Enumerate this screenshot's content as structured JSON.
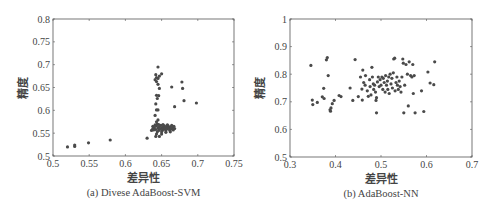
{
  "chart_data": [
    {
      "type": "scatter",
      "caption": "(a) Divese AdaBoost-SVM",
      "xlabel": "差异性",
      "ylabel": "精度",
      "xlim": [
        0.5,
        0.75
      ],
      "ylim": [
        0.5,
        0.8
      ],
      "xticks": [
        "0.5",
        "0.55",
        "0.6",
        "0.65",
        "0.7",
        "0.75"
      ],
      "yticks": [
        "0.5",
        "0.55",
        "0.6",
        "0.65",
        "0.7",
        "0.75",
        "0.8"
      ],
      "grid": false,
      "points": [
        [
          0.52,
          0.52
        ],
        [
          0.53,
          0.521
        ],
        [
          0.53,
          0.524
        ],
        [
          0.549,
          0.529
        ],
        [
          0.579,
          0.535
        ],
        [
          0.63,
          0.539
        ],
        [
          0.642,
          0.543
        ],
        [
          0.647,
          0.543
        ],
        [
          0.643,
          0.548
        ],
        [
          0.65,
          0.548
        ],
        [
          0.636,
          0.556
        ],
        [
          0.638,
          0.56
        ],
        [
          0.638,
          0.565
        ],
        [
          0.64,
          0.562
        ],
        [
          0.642,
          0.558
        ],
        [
          0.643,
          0.566
        ],
        [
          0.645,
          0.561
        ],
        [
          0.646,
          0.556
        ],
        [
          0.647,
          0.564
        ],
        [
          0.648,
          0.559
        ],
        [
          0.649,
          0.567
        ],
        [
          0.65,
          0.561
        ],
        [
          0.651,
          0.556
        ],
        [
          0.652,
          0.564
        ],
        [
          0.653,
          0.559
        ],
        [
          0.654,
          0.566
        ],
        [
          0.655,
          0.561
        ],
        [
          0.656,
          0.556
        ],
        [
          0.657,
          0.564
        ],
        [
          0.658,
          0.56
        ],
        [
          0.659,
          0.566
        ],
        [
          0.66,
          0.561
        ],
        [
          0.661,
          0.557
        ],
        [
          0.662,
          0.564
        ],
        [
          0.663,
          0.559
        ],
        [
          0.664,
          0.567
        ],
        [
          0.665,
          0.562
        ],
        [
          0.666,
          0.557
        ],
        [
          0.667,
          0.565
        ],
        [
          0.668,
          0.56
        ],
        [
          0.641,
          0.568
        ],
        [
          0.644,
          0.57
        ],
        [
          0.646,
          0.569
        ],
        [
          0.652,
          0.569
        ],
        [
          0.658,
          0.568
        ],
        [
          0.639,
          0.557
        ],
        [
          0.644,
          0.553
        ],
        [
          0.65,
          0.553
        ],
        [
          0.656,
          0.552
        ],
        [
          0.662,
          0.553
        ],
        [
          0.643,
          0.575
        ],
        [
          0.645,
          0.579
        ],
        [
          0.641,
          0.589
        ],
        [
          0.645,
          0.601
        ],
        [
          0.643,
          0.601
        ],
        [
          0.642,
          0.614
        ],
        [
          0.644,
          0.626
        ],
        [
          0.646,
          0.632
        ],
        [
          0.643,
          0.633
        ],
        [
          0.647,
          0.648
        ],
        [
          0.645,
          0.657
        ],
        [
          0.643,
          0.663
        ],
        [
          0.641,
          0.667
        ],
        [
          0.645,
          0.67
        ],
        [
          0.643,
          0.672
        ],
        [
          0.647,
          0.675
        ],
        [
          0.642,
          0.678
        ],
        [
          0.65,
          0.68
        ],
        [
          0.645,
          0.695
        ],
        [
          0.664,
          0.651
        ],
        [
          0.668,
          0.608
        ],
        [
          0.678,
          0.662
        ],
        [
          0.679,
          0.648
        ],
        [
          0.681,
          0.621
        ],
        [
          0.698,
          0.616
        ]
      ]
    },
    {
      "type": "scatter",
      "caption": "(b) AdaBoost-NN",
      "xlabel": "差异性",
      "ylabel": "精度",
      "xlim": [
        0.3,
        0.7
      ],
      "ylim": [
        0.5,
        1.0
      ],
      "xticks": [
        "0.3",
        "0.4",
        "0.5",
        "0.6",
        "0.7"
      ],
      "yticks": [
        "0.5",
        "0.6",
        "0.7",
        "0.8",
        "0.9",
        "1"
      ],
      "grid": false,
      "points": [
        [
          0.346,
          0.832
        ],
        [
          0.349,
          0.706
        ],
        [
          0.35,
          0.69
        ],
        [
          0.36,
          0.698
        ],
        [
          0.371,
          0.718
        ],
        [
          0.375,
          0.712
        ],
        [
          0.374,
          0.749
        ],
        [
          0.38,
          0.852
        ],
        [
          0.382,
          0.86
        ],
        [
          0.384,
          0.795
        ],
        [
          0.388,
          0.671
        ],
        [
          0.389,
          0.666
        ],
        [
          0.39,
          0.678
        ],
        [
          0.393,
          0.693
        ],
        [
          0.397,
          0.705
        ],
        [
          0.408,
          0.723
        ],
        [
          0.412,
          0.719
        ],
        [
          0.432,
          0.75
        ],
        [
          0.438,
          0.705
        ],
        [
          0.443,
          0.853
        ],
        [
          0.45,
          0.719
        ],
        [
          0.455,
          0.79
        ],
        [
          0.458,
          0.746
        ],
        [
          0.459,
          0.706
        ],
        [
          0.46,
          0.815
        ],
        [
          0.462,
          0.77
        ],
        [
          0.465,
          0.76
        ],
        [
          0.466,
          0.795
        ],
        [
          0.47,
          0.74
        ],
        [
          0.472,
          0.72
        ],
        [
          0.475,
          0.78
        ],
        [
          0.476,
          0.755
        ],
        [
          0.478,
          0.725
        ],
        [
          0.48,
          0.825
        ],
        [
          0.481,
          0.79
        ],
        [
          0.483,
          0.765
        ],
        [
          0.484,
          0.745
        ],
        [
          0.486,
          0.76
        ],
        [
          0.488,
          0.735
        ],
        [
          0.489,
          0.705
        ],
        [
          0.49,
          0.66
        ],
        [
          0.49,
          0.715
        ],
        [
          0.492,
          0.772
        ],
        [
          0.494,
          0.79
        ],
        [
          0.496,
          0.755
        ],
        [
          0.498,
          0.78
        ],
        [
          0.5,
          0.76
        ],
        [
          0.502,
          0.79
        ],
        [
          0.504,
          0.745
        ],
        [
          0.505,
          0.785
        ],
        [
          0.507,
          0.77
        ],
        [
          0.509,
          0.735
        ],
        [
          0.51,
          0.795
        ],
        [
          0.512,
          0.76
        ],
        [
          0.514,
          0.775
        ],
        [
          0.515,
          0.745
        ],
        [
          0.517,
          0.79
        ],
        [
          0.518,
          0.73
        ],
        [
          0.52,
          0.8
        ],
        [
          0.522,
          0.765
        ],
        [
          0.524,
          0.785
        ],
        [
          0.525,
          0.75
        ],
        [
          0.527,
          0.805
        ],
        [
          0.528,
          0.855
        ],
        [
          0.53,
          0.858
        ],
        [
          0.531,
          0.74
        ],
        [
          0.533,
          0.77
        ],
        [
          0.535,
          0.79
        ],
        [
          0.536,
          0.76
        ],
        [
          0.538,
          0.745
        ],
        [
          0.54,
          0.775
        ],
        [
          0.542,
          0.755
        ],
        [
          0.544,
          0.735
        ],
        [
          0.546,
          0.79
        ],
        [
          0.548,
          0.855
        ],
        [
          0.549,
          0.84
        ],
        [
          0.55,
          0.66
        ],
        [
          0.552,
          0.76
        ],
        [
          0.555,
          0.835
        ],
        [
          0.558,
          0.8
        ],
        [
          0.56,
          0.685
        ],
        [
          0.562,
          0.845
        ],
        [
          0.565,
          0.795
        ],
        [
          0.568,
          0.79
        ],
        [
          0.57,
          0.835
        ],
        [
          0.571,
          0.73
        ],
        [
          0.573,
          0.795
        ],
        [
          0.575,
          0.66
        ],
        [
          0.589,
          0.74
        ],
        [
          0.594,
          0.665
        ],
        [
          0.603,
          0.808
        ],
        [
          0.608,
          0.768
        ],
        [
          0.616,
          0.762
        ],
        [
          0.618,
          0.845
        ]
      ]
    }
  ]
}
